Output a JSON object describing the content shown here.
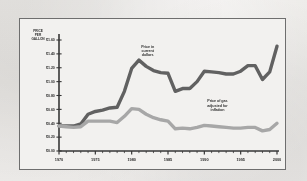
{
  "figure": {
    "background_color": "#f2f1ef",
    "frame_color": "#6e6e6e",
    "page_color": "#e9e8e6"
  },
  "chart_data": {
    "type": "line",
    "title": "",
    "subtitle": "",
    "xlabel": "",
    "ylabel": "PRICE PER GALLON",
    "ylabel_lines": [
      "PRICE",
      "PER",
      "GALLON"
    ],
    "xlim": [
      1970,
      2000
    ],
    "ylim": [
      0.0,
      1.6
    ],
    "grid": false,
    "legend_position": "inline-annotations",
    "x_tick_labels": [
      "1970",
      "1975",
      "1980",
      "1985",
      "1990",
      "1995",
      "2000"
    ],
    "x_tick_values": [
      1970,
      1975,
      1980,
      1985,
      1990,
      1995,
      2000
    ],
    "x_minor_tick_step": 1,
    "y_tick_labels": [
      "$0.00",
      "$0.20",
      "$0.40",
      "$0.60",
      "$0.80",
      "$1.00",
      "$1.20",
      "$1.40",
      "$1.60"
    ],
    "y_tick_values": [
      0.0,
      0.2,
      0.4,
      0.6,
      0.8,
      1.0,
      1.2,
      1.4,
      1.6
    ],
    "x": [
      1970,
      1971,
      1972,
      1973,
      1974,
      1975,
      1976,
      1977,
      1978,
      1979,
      1980,
      1981,
      1982,
      1983,
      1984,
      1985,
      1986,
      1987,
      1988,
      1989,
      1990,
      1991,
      1992,
      1993,
      1994,
      1995,
      1996,
      1997,
      1998,
      1999,
      2000
    ],
    "series": [
      {
        "name": "Price in current dollars",
        "color": "#595959",
        "line_width": 3.4,
        "values": [
          0.36,
          0.36,
          0.36,
          0.39,
          0.53,
          0.57,
          0.59,
          0.62,
          0.63,
          0.86,
          1.19,
          1.31,
          1.22,
          1.16,
          1.13,
          1.12,
          0.86,
          0.9,
          0.9,
          1.0,
          1.15,
          1.14,
          1.13,
          1.11,
          1.11,
          1.15,
          1.23,
          1.23,
          1.03,
          1.14,
          1.51
        ],
        "annotation": {
          "lines": [
            "Price in",
            "current",
            "dollars"
          ],
          "x": 1982.2,
          "y": 1.49
        }
      },
      {
        "name": "Price of gas adjusted for inflation",
        "color": "#a3a3a3",
        "line_width": 3.4,
        "values": [
          0.36,
          0.35,
          0.34,
          0.35,
          0.43,
          0.43,
          0.43,
          0.43,
          0.41,
          0.5,
          0.61,
          0.6,
          0.53,
          0.48,
          0.45,
          0.43,
          0.32,
          0.33,
          0.32,
          0.34,
          0.37,
          0.36,
          0.35,
          0.34,
          0.33,
          0.33,
          0.34,
          0.34,
          0.29,
          0.31,
          0.4
        ],
        "annotation": {
          "lines": [
            "Price of gas",
            "adjusted for",
            "inflation"
          ],
          "x": 1991.8,
          "y": 0.7
        }
      }
    ]
  }
}
